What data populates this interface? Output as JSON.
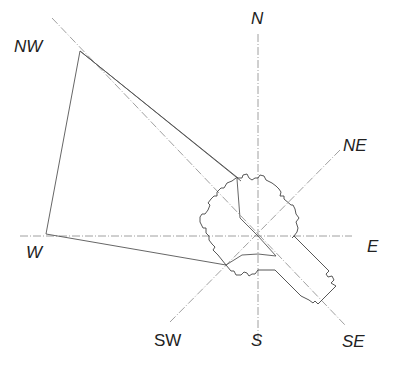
{
  "diagram": {
    "center": [
      258,
      236
    ],
    "labels": {
      "nw": "NW",
      "n": "N",
      "ne": "NE",
      "e": "E",
      "w": "W",
      "sw": "SW",
      "s": "S",
      "se": "SE"
    },
    "colors": {
      "axis": "#888888",
      "outline": "#444444",
      "text": "#222222"
    }
  }
}
